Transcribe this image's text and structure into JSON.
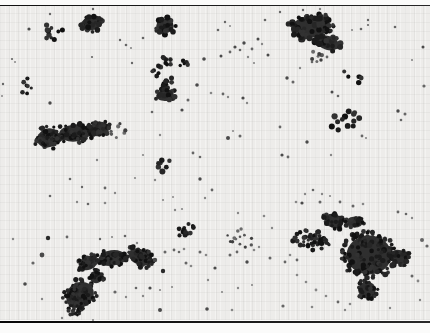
{
  "meta": {
    "width": 430,
    "height": 333
  },
  "frame": {
    "margin_bg": "#fbfbfa",
    "rule_color_dark": "#101010",
    "rule_color_light": "#262626",
    "top_rule_y": 4.5,
    "bottom_rule_y": 320.5
  },
  "field": {
    "bg": "#edecea",
    "top": 6.2,
    "height": 314,
    "grid_step": 9
  },
  "palettes": {
    "dark": [
      "#111111",
      "#1b1b1b",
      "#262626",
      "#323232"
    ],
    "mid": [
      "#3f3f3f",
      "#565656",
      "#6b6b6b"
    ],
    "light": [
      "#7a7a7a",
      "#8d8d8d",
      "#a0a0a0"
    ],
    "singles": [
      "#2a2a2a",
      "#4a4a4a",
      "#666666",
      "#878787",
      "#a2a2a2"
    ],
    "base": "#1e1e1e",
    "hole": "#efeeec"
  },
  "clusters": [
    {
      "name": "top-left-loose",
      "cx": 52,
      "cy": 33,
      "rx": 11,
      "ry": 11,
      "rot": 0,
      "count": 10,
      "rmin": 1.8,
      "rmax": 2.8,
      "tone": "dark",
      "base": false,
      "seed": 11
    },
    {
      "name": "top-cluster-a",
      "cx": 91,
      "cy": 24,
      "rx": 13,
      "ry": 8,
      "rot": -5,
      "count": 24,
      "rmin": 1.8,
      "rmax": 3.0,
      "tone": "dark",
      "base": true,
      "seed": 21
    },
    {
      "name": "top-cluster-b",
      "cx": 165,
      "cy": 26,
      "rx": 11,
      "ry": 9,
      "rot": 0,
      "count": 22,
      "rmin": 1.8,
      "rmax": 3.0,
      "tone": "dark",
      "base": true,
      "seed": 31
    },
    {
      "name": "top-right-main",
      "cx": 310,
      "cy": 27,
      "rx": 24,
      "ry": 14,
      "rot": -8,
      "count": 65,
      "rmin": 1.8,
      "rmax": 3.2,
      "tone": "dark",
      "base": true,
      "seed": 41
    },
    {
      "name": "top-right-lower-lobe",
      "cx": 328,
      "cy": 43,
      "rx": 14,
      "ry": 9,
      "rot": 15,
      "count": 24,
      "rmin": 1.8,
      "rmax": 3.0,
      "tone": "dark",
      "base": true,
      "seed": 42
    },
    {
      "name": "top-right-trail",
      "cx": 316,
      "cy": 57,
      "rx": 7,
      "ry": 6,
      "rot": 0,
      "count": 7,
      "rmin": 1.4,
      "rmax": 2.2,
      "tone": "mid",
      "base": false,
      "seed": 43
    },
    {
      "name": "left-small-group",
      "cx": 27,
      "cy": 86,
      "rx": 6,
      "ry": 10,
      "rot": 0,
      "count": 7,
      "rmin": 1.6,
      "rmax": 2.4,
      "tone": "dark",
      "base": false,
      "seed": 51
    },
    {
      "name": "chain-top",
      "cx": 167,
      "cy": 60,
      "rx": 9,
      "ry": 5,
      "rot": 30,
      "count": 9,
      "rmin": 1.8,
      "rmax": 2.6,
      "tone": "dark",
      "base": false,
      "seed": 61
    },
    {
      "name": "chain-offshoot",
      "cx": 183,
      "cy": 63,
      "rx": 5,
      "ry": 6,
      "rot": 0,
      "count": 5,
      "rmin": 1.6,
      "rmax": 2.4,
      "tone": "dark",
      "base": false,
      "seed": 62
    },
    {
      "name": "chain-mid-upper",
      "cx": 158,
      "cy": 71,
      "rx": 6,
      "ry": 6,
      "rot": 0,
      "count": 7,
      "rmin": 1.8,
      "rmax": 2.6,
      "tone": "dark",
      "base": false,
      "seed": 63
    },
    {
      "name": "chain-mid-lower",
      "cx": 169,
      "cy": 82,
      "rx": 7,
      "ry": 6,
      "rot": -20,
      "count": 9,
      "rmin": 1.8,
      "rmax": 2.6,
      "tone": "dark",
      "base": false,
      "seed": 64
    },
    {
      "name": "chain-bottom-blob",
      "cx": 165,
      "cy": 95,
      "rx": 11,
      "ry": 7,
      "rot": -10,
      "count": 18,
      "rmin": 1.8,
      "rmax": 2.8,
      "tone": "dark",
      "base": true,
      "seed": 65
    },
    {
      "name": "left-elongated-west",
      "cx": 48,
      "cy": 138,
      "rx": 14,
      "ry": 12,
      "rot": -20,
      "count": 45,
      "rmin": 1.6,
      "rmax": 2.8,
      "tone": "dark",
      "base": true,
      "seed": 71
    },
    {
      "name": "left-elongated-mid",
      "cx": 75,
      "cy": 133,
      "rx": 20,
      "ry": 11,
      "rot": -5,
      "count": 55,
      "rmin": 1.6,
      "rmax": 2.8,
      "tone": "dark",
      "base": true,
      "seed": 72
    },
    {
      "name": "left-elongated-east",
      "cx": 99,
      "cy": 129,
      "rx": 13,
      "ry": 9,
      "rot": -10,
      "count": 30,
      "rmin": 1.6,
      "rmax": 2.8,
      "tone": "dark",
      "base": true,
      "seed": 73
    },
    {
      "name": "left-elongated-stragglers",
      "cx": 118,
      "cy": 130,
      "rx": 8,
      "ry": 9,
      "rot": 0,
      "count": 7,
      "rmin": 1.4,
      "rmax": 2.2,
      "tone": "mid",
      "base": false,
      "seed": 74
    },
    {
      "name": "right-upper-arc",
      "cx": 352,
      "cy": 77,
      "rx": 11,
      "ry": 6,
      "rot": 25,
      "count": 6,
      "rmin": 2.0,
      "rmax": 2.8,
      "tone": "dark",
      "base": false,
      "seed": 81
    },
    {
      "name": "right-mid-group",
      "cx": 344,
      "cy": 120,
      "rx": 16,
      "ry": 10,
      "rot": -18,
      "count": 13,
      "rmin": 2.2,
      "rmax": 3.2,
      "tone": "dark",
      "base": false,
      "seed": 82
    },
    {
      "name": "center-small-group",
      "cx": 163,
      "cy": 165,
      "rx": 8,
      "ry": 7,
      "rot": 0,
      "count": 7,
      "rmin": 2.0,
      "rmax": 3.0,
      "tone": "dark",
      "base": false,
      "seed": 91
    },
    {
      "name": "lower-center-group",
      "cx": 185,
      "cy": 229,
      "rx": 11,
      "ry": 7,
      "rot": -10,
      "count": 13,
      "rmin": 1.8,
      "rmax": 2.6,
      "tone": "dark",
      "base": false,
      "seed": 101
    },
    {
      "name": "lower-center-loose",
      "cx": 241,
      "cy": 239,
      "rx": 15,
      "ry": 10,
      "rot": 0,
      "count": 13,
      "rmin": 1.2,
      "rmax": 2.0,
      "tone": "mid",
      "base": false,
      "seed": 102
    },
    {
      "name": "bottom-left-arm-east",
      "cx": 140,
      "cy": 257,
      "rx": 15,
      "ry": 10,
      "rot": 25,
      "count": 40,
      "rmin": 1.6,
      "rmax": 2.6,
      "tone": "dark",
      "base": true,
      "seed": 111
    },
    {
      "name": "bottom-left-arm-mid",
      "cx": 112,
      "cy": 258,
      "rx": 17,
      "ry": 10,
      "rot": -8,
      "count": 45,
      "rmin": 1.6,
      "rmax": 2.6,
      "tone": "dark",
      "base": true,
      "seed": 112
    },
    {
      "name": "bottom-left-arm-west",
      "cx": 88,
      "cy": 263,
      "rx": 12,
      "ry": 9,
      "rot": -20,
      "count": 30,
      "rmin": 1.6,
      "rmax": 2.6,
      "tone": "dark",
      "base": true,
      "seed": 113
    },
    {
      "name": "bottom-left-neck",
      "cx": 96,
      "cy": 277,
      "rx": 8,
      "ry": 8,
      "rot": 0,
      "count": 18,
      "rmin": 1.6,
      "rmax": 2.4,
      "tone": "dark",
      "base": true,
      "seed": 114
    },
    {
      "name": "bottom-left-lobe",
      "cx": 80,
      "cy": 295,
      "rx": 18,
      "ry": 16,
      "rot": -35,
      "count": 75,
      "rmin": 1.6,
      "rmax": 2.6,
      "tone": "dark",
      "base": true,
      "seed": 115
    },
    {
      "name": "bottom-left-tip",
      "cx": 75,
      "cy": 310,
      "rx": 8,
      "ry": 6,
      "rot": -30,
      "count": 12,
      "rmin": 1.4,
      "rmax": 2.2,
      "tone": "dark",
      "base": false,
      "seed": 116
    },
    {
      "name": "bottom-right-west-band",
      "cx": 312,
      "cy": 240,
      "rx": 22,
      "ry": 10,
      "rot": 10,
      "count": 50,
      "rmin": 1.6,
      "rmax": 2.6,
      "tone": "dark",
      "base": false,
      "seed": 121
    },
    {
      "name": "bottom-right-knob",
      "cx": 334,
      "cy": 221,
      "rx": 12,
      "ry": 9,
      "rot": 20,
      "count": 25,
      "rmin": 1.6,
      "rmax": 2.6,
      "tone": "dark",
      "base": true,
      "seed": 122
    },
    {
      "name": "bottom-right-top-bump",
      "cx": 355,
      "cy": 222,
      "rx": 10,
      "ry": 7,
      "rot": 0,
      "count": 18,
      "rmin": 1.6,
      "rmax": 2.6,
      "tone": "dark",
      "base": true,
      "seed": 123
    },
    {
      "name": "bottom-right-main",
      "cx": 369,
      "cy": 255,
      "rx": 28,
      "ry": 25,
      "rot": 0,
      "count": 130,
      "rmin": 1.6,
      "rmax": 2.8,
      "tone": "dark",
      "base": true,
      "seed": 124
    },
    {
      "name": "bottom-right-east-arm",
      "cx": 399,
      "cy": 257,
      "rx": 12,
      "ry": 9,
      "rot": 15,
      "count": 25,
      "rmin": 1.6,
      "rmax": 2.6,
      "tone": "dark",
      "base": true,
      "seed": 125
    },
    {
      "name": "bottom-right-tail",
      "cx": 367,
      "cy": 290,
      "rx": 11,
      "ry": 11,
      "rot": 0,
      "count": 30,
      "rmin": 1.6,
      "rmax": 2.4,
      "tone": "dark",
      "base": true,
      "seed": 126
    }
  ],
  "holes": [
    {
      "x": 339,
      "y": 239,
      "r": 5
    }
  ],
  "singles": [
    [
      29,
      29,
      1.6,
      1
    ],
    [
      50,
      14,
      1.2,
      2
    ],
    [
      93,
      9,
      1.2,
      2
    ],
    [
      12,
      59,
      1.1,
      2
    ],
    [
      15,
      62,
      1.0,
      3
    ],
    [
      3,
      84,
      1.2,
      2
    ],
    [
      2,
      96,
      1.0,
      3
    ],
    [
      92,
      57,
      1.1,
      2
    ],
    [
      132,
      63,
      1.2,
      2
    ],
    [
      120,
      40,
      1.2,
      2
    ],
    [
      126,
      45,
      1.3,
      2
    ],
    [
      131,
      48,
      1.1,
      3
    ],
    [
      143,
      38,
      1.3,
      2
    ],
    [
      218,
      30,
      1.3,
      2
    ],
    [
      225,
      22,
      1.2,
      2
    ],
    [
      230,
      26,
      1.0,
      3
    ],
    [
      204,
      59,
      1.8,
      1
    ],
    [
      197,
      85,
      1.8,
      1
    ],
    [
      188,
      100,
      1.5,
      2
    ],
    [
      182,
      110,
      1.6,
      1
    ],
    [
      211,
      93,
      1.3,
      3
    ],
    [
      223,
      94,
      1.4,
      2
    ],
    [
      228,
      97,
      1.2,
      3
    ],
    [
      243,
      98,
      1.6,
      1
    ],
    [
      247,
      103,
      1.2,
      3
    ],
    [
      265,
      20,
      1.3,
      2
    ],
    [
      280,
      12,
      1.2,
      2
    ],
    [
      303,
      10,
      1.2,
      2
    ],
    [
      320,
      9,
      1.2,
      3
    ],
    [
      352,
      30,
      1.1,
      3
    ],
    [
      327,
      57,
      1.4,
      2
    ],
    [
      312,
      62,
      1.3,
      2
    ],
    [
      300,
      68,
      1.2,
      3
    ],
    [
      268,
      55,
      1.5,
      1
    ],
    [
      254,
      63,
      1.1,
      3
    ],
    [
      287,
      78,
      1.7,
      1
    ],
    [
      293,
      82,
      1.5,
      2
    ],
    [
      361,
      29,
      1.3,
      2
    ],
    [
      368,
      20,
      1.2,
      2
    ],
    [
      368,
      25,
      1.1,
      2
    ],
    [
      395,
      27,
      1.3,
      2
    ],
    [
      423,
      47,
      1.5,
      1
    ],
    [
      412,
      60,
      1.1,
      3
    ],
    [
      424,
      86,
      1.6,
      2
    ],
    [
      332,
      92,
      1.5,
      1
    ],
    [
      338,
      96,
      1.3,
      2
    ],
    [
      398,
      111,
      1.7,
      1
    ],
    [
      405,
      114,
      1.5,
      2
    ],
    [
      401,
      120,
      1.3,
      2
    ],
    [
      362,
      136,
      1.4,
      2
    ],
    [
      366,
      138,
      1.1,
      3
    ],
    [
      331,
      155,
      1.2,
      3
    ],
    [
      221,
      56,
      1.5,
      1
    ],
    [
      230,
      52,
      1.4,
      2
    ],
    [
      235,
      47,
      1.6,
      1
    ],
    [
      240,
      50,
      1.3,
      2
    ],
    [
      244,
      43,
      1.7,
      1
    ],
    [
      252,
      49,
      1.4,
      2
    ],
    [
      258,
      39,
      1.5,
      1
    ],
    [
      262,
      44,
      1.2,
      3
    ],
    [
      248,
      57,
      1.2,
      3
    ],
    [
      228,
      138,
      2.0,
      1
    ],
    [
      240,
      136,
      1.5,
      2
    ],
    [
      233,
      131,
      1.0,
      3
    ],
    [
      280,
      127,
      1.4,
      2
    ],
    [
      307,
      142,
      1.7,
      1
    ],
    [
      282,
      155,
      1.6,
      1
    ],
    [
      288,
      157,
      1.4,
      2
    ],
    [
      193,
      153,
      1.4,
      2
    ],
    [
      200,
      157,
      1.3,
      2
    ],
    [
      152,
      112,
      1.3,
      2
    ],
    [
      160,
      135,
      1.2,
      3
    ],
    [
      143,
      155,
      1.1,
      3
    ],
    [
      97,
      160,
      1.2,
      3
    ],
    [
      135,
      178,
      1.1,
      3
    ],
    [
      155,
      180,
      1.2,
      3
    ],
    [
      200,
      179,
      1.7,
      1
    ],
    [
      212,
      190,
      1.4,
      2
    ],
    [
      163,
      200,
      1.1,
      3
    ],
    [
      173,
      197,
      1.0,
      3
    ],
    [
      50,
      103,
      1.7,
      1
    ],
    [
      70,
      179,
      1.3,
      2
    ],
    [
      82,
      187,
      1.2,
      2
    ],
    [
      50,
      196,
      1.3,
      2
    ],
    [
      77,
      202,
      1.2,
      3
    ],
    [
      105,
      188,
      1.4,
      2
    ],
    [
      115,
      193,
      1.2,
      3
    ],
    [
      88,
      204,
      1.3,
      2
    ],
    [
      105,
      203,
      1.3,
      3
    ],
    [
      13,
      239,
      1.2,
      3
    ],
    [
      48,
      238,
      2.2,
      0
    ],
    [
      67,
      237,
      1.4,
      2
    ],
    [
      42,
      255,
      2.4,
      1
    ],
    [
      33,
      263,
      1.6,
      2
    ],
    [
      25,
      284,
      1.8,
      1
    ],
    [
      42,
      299,
      1.2,
      3
    ],
    [
      62,
      318,
      1.2,
      3
    ],
    [
      93,
      320,
      1.1,
      3
    ],
    [
      100,
      239,
      1.2,
      2
    ],
    [
      112,
      237,
      1.1,
      3
    ],
    [
      125,
      236,
      1.3,
      2
    ],
    [
      137,
      243,
      1.2,
      3
    ],
    [
      155,
      260,
      2.2,
      1
    ],
    [
      163,
      271,
      2.2,
      0
    ],
    [
      150,
      288,
      1.6,
      1
    ],
    [
      143,
      296,
      1.2,
      3
    ],
    [
      115,
      292,
      1.6,
      2
    ],
    [
      126,
      297,
      1.2,
      3
    ],
    [
      136,
      288,
      1.3,
      2
    ],
    [
      175,
      210,
      1.2,
      3
    ],
    [
      182,
      209,
      1.1,
      3
    ],
    [
      205,
      198,
      1.2,
      3
    ],
    [
      165,
      252,
      1.5,
      2
    ],
    [
      174,
      250,
      1.4,
      2
    ],
    [
      179,
      252,
      1.3,
      2
    ],
    [
      184,
      249,
      1.3,
      3
    ],
    [
      200,
      252,
      1.5,
      2
    ],
    [
      206,
      255,
      1.3,
      3
    ],
    [
      186,
      263,
      1.5,
      2
    ],
    [
      191,
      266,
      1.3,
      3
    ],
    [
      215,
      268,
      1.6,
      1
    ],
    [
      230,
      255,
      1.5,
      2
    ],
    [
      237,
      252,
      1.4,
      2
    ],
    [
      247,
      262,
      1.7,
      1
    ],
    [
      254,
      250,
      1.3,
      3
    ],
    [
      259,
      247,
      1.2,
      3
    ],
    [
      270,
      258,
      1.5,
      2
    ],
    [
      285,
      262,
      1.4,
      2
    ],
    [
      160,
      290,
      1.1,
      3
    ],
    [
      172,
      287,
      1.1,
      3
    ],
    [
      208,
      280,
      1.2,
      3
    ],
    [
      222,
      292,
      1.1,
      3
    ],
    [
      238,
      288,
      1.2,
      3
    ],
    [
      252,
      285,
      1.1,
      3
    ],
    [
      160,
      310,
      2.0,
      1
    ],
    [
      207,
      309,
      1.8,
      1
    ],
    [
      232,
      310,
      1.3,
      3
    ],
    [
      283,
      306,
      1.6,
      2
    ],
    [
      312,
      307,
      1.3,
      3
    ],
    [
      238,
      213,
      1.2,
      3
    ],
    [
      302,
      203,
      1.6,
      1
    ],
    [
      320,
      202,
      1.5,
      2
    ],
    [
      340,
      202,
      1.4,
      2
    ],
    [
      353,
      206,
      1.5,
      2
    ],
    [
      363,
      204,
      1.3,
      3
    ],
    [
      296,
      202,
      1.3,
      3
    ],
    [
      305,
      194,
      1.2,
      3
    ],
    [
      313,
      190,
      1.3,
      2
    ],
    [
      322,
      194,
      1.2,
      3
    ],
    [
      330,
      196,
      1.1,
      3
    ],
    [
      398,
      212,
      1.4,
      2
    ],
    [
      406,
      214,
      1.3,
      2
    ],
    [
      412,
      218,
      1.2,
      3
    ],
    [
      422,
      240,
      2.0,
      2
    ],
    [
      427,
      246,
      1.6,
      2
    ],
    [
      412,
      276,
      1.5,
      2
    ],
    [
      418,
      281,
      1.4,
      3
    ],
    [
      420,
      300,
      1.2,
      3
    ],
    [
      297,
      275,
      1.3,
      3
    ],
    [
      306,
      282,
      1.3,
      3
    ],
    [
      316,
      290,
      1.4,
      3
    ],
    [
      326,
      296,
      1.3,
      3
    ],
    [
      338,
      302,
      1.4,
      2
    ],
    [
      350,
      304,
      1.3,
      3
    ],
    [
      297,
      260,
      1.4,
      2
    ],
    [
      290,
      255,
      1.3,
      3
    ],
    [
      264,
      216,
      1.3,
      3
    ],
    [
      272,
      228,
      1.2,
      3
    ],
    [
      390,
      308,
      1.2,
      3
    ],
    [
      345,
      310,
      1.2,
      3
    ]
  ]
}
